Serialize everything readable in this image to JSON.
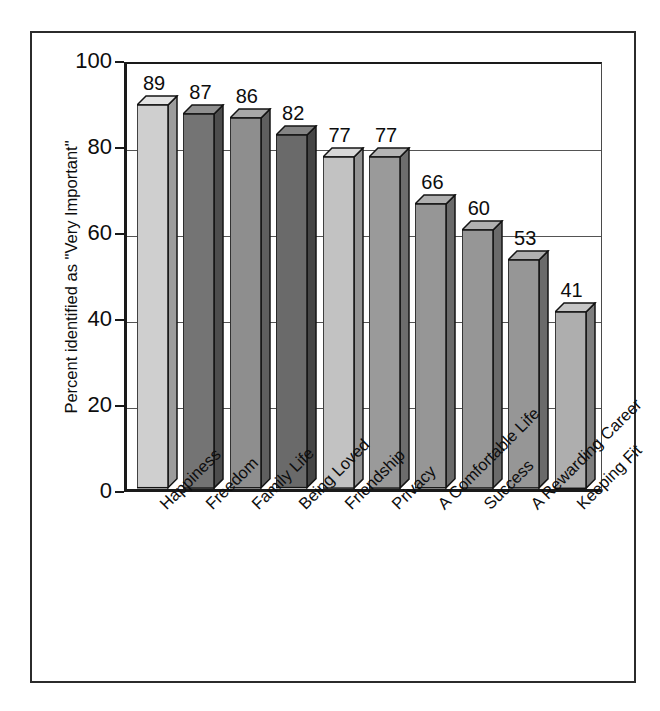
{
  "figure": {
    "frame_color": "#2b2b2b",
    "background": "#ffffff"
  },
  "chart_data": {
    "type": "bar",
    "title": "",
    "xlabel": "",
    "ylabel": "Percent identified as \"Very Important\"",
    "ylim": [
      0,
      100
    ],
    "yticks": [
      0,
      20,
      40,
      60,
      80,
      100
    ],
    "ytick_labels": [
      "0",
      "20",
      "40",
      "60",
      "80",
      "100"
    ],
    "grid": "horizontal",
    "legend": "none",
    "categories": [
      "Happiness",
      "Freedom",
      "Family Life",
      "Being Loved",
      "Friendship",
      "Privacy",
      "A Comfortable Life",
      "Success",
      "A Rewarding Career",
      "Keeping Fit"
    ],
    "values": [
      89,
      87,
      86,
      82,
      77,
      77,
      66,
      60,
      53,
      41
    ],
    "value_labels": [
      "89",
      "87",
      "86",
      "82",
      "77",
      "77",
      "66",
      "60",
      "53",
      "41"
    ],
    "bar_colors": [
      "#cfcfcf",
      "#747474",
      "#8e8e8e",
      "#6a6a6a",
      "#c2c2c2",
      "#9a9a9a",
      "#969696",
      "#969696",
      "#969696",
      "#aeaeae"
    ],
    "bar_side_colors": [
      "#9c9c9c",
      "#4d4d4d",
      "#5f5f5f",
      "#454545",
      "#939393",
      "#6d6d6d",
      "#6a6a6a",
      "#6a6a6a",
      "#6a6a6a",
      "#7e7e7e"
    ],
    "bar_top_colors": [
      "#e3e3e3",
      "#8f8f8f",
      "#a8a8a8",
      "#848484",
      "#d8d8d8",
      "#b4b4b4",
      "#b0b0b0",
      "#b0b0b0",
      "#b0b0b0",
      "#c6c6c6"
    ],
    "edge_color": "#141414",
    "axis_color": "#1a1a1a",
    "gridline_color": "#545454",
    "label_rotation_deg": -45
  }
}
